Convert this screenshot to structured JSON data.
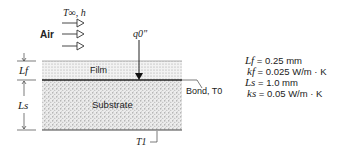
{
  "flow": {
    "fluid_label": "Air",
    "conditions_label": "T∞, h"
  },
  "heat_flux": {
    "label": "q0\""
  },
  "layers": {
    "film_label": "Film",
    "substrate_label": "Substrate"
  },
  "dimensions": {
    "film_thickness_label": "Lf",
    "substrate_thickness_label": "Ls"
  },
  "interface": {
    "bond_label": "Bond, T0"
  },
  "bottom": {
    "temperature_label": "T1"
  },
  "properties": [
    {
      "symbol": "Lf",
      "value": "= 0.25 mm"
    },
    {
      "symbol": "kf",
      "value": "= 0.025 W/m · K"
    },
    {
      "symbol": "Ls",
      "value": "= 1.0 mm"
    },
    {
      "symbol": "ks",
      "value": "= 0.05 W/m · K"
    }
  ]
}
